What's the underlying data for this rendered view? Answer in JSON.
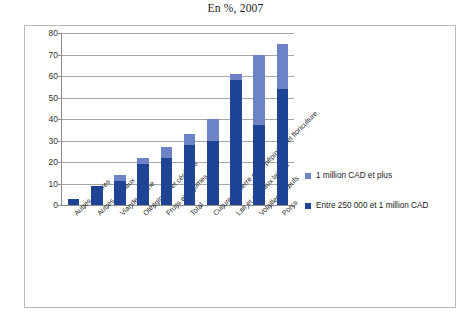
{
  "chart_data": {
    "type": "bar",
    "title": "En %, 2007",
    "subtitle": "",
    "xlabel": "",
    "ylabel": "",
    "ylim": [
      0,
      80
    ],
    "ytick_step": 10,
    "yticks": [
      0,
      10,
      20,
      30,
      40,
      50,
      60,
      70,
      80
    ],
    "grid": true,
    "stacked": true,
    "legend_position": "right",
    "categories": [
      "Autres cultures",
      "Autres animaux",
      "Viande bovine",
      "Oléagineux et céréales",
      "Fruits et légumes",
      "Total",
      "Culture en serre et en pépinière et floriculture",
      "Lait et animaux laitiers",
      "Volailles et œufs",
      "Porcs"
    ],
    "series": [
      {
        "name": "Entre 250 000 et 1 million CAD",
        "color": "#1f4496",
        "values": [
          3,
          9,
          11,
          19,
          22,
          28,
          30,
          58,
          37,
          54
        ]
      },
      {
        "name": "1 million CAD et plus",
        "color": "#6e83c6",
        "values": [
          0,
          0,
          3,
          3,
          5,
          5,
          10,
          3,
          33,
          21
        ]
      }
    ],
    "totals": [
      3,
      9,
      14,
      22,
      27,
      33,
      40,
      61,
      70,
      75
    ]
  },
  "legend": {
    "items": [
      {
        "label": "1 million  CAD et plus",
        "color": "#6e83c6"
      },
      {
        "label": "Entre 250 000 et 1 million  CAD",
        "color": "#1f4496"
      }
    ]
  }
}
